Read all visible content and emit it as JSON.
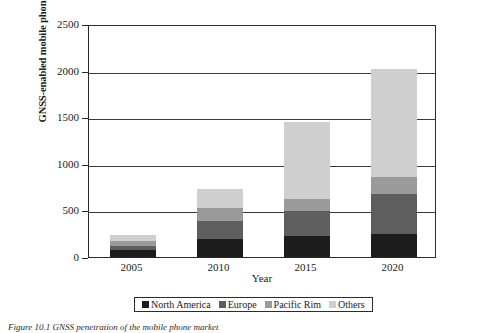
{
  "chart_data": {
    "type": "bar",
    "stacked": true,
    "title": "",
    "xlabel": "Year",
    "ylabel": "GNSS-enabled mobile phones in millions",
    "categories": [
      "2005",
      "2010",
      "2015",
      "2020"
    ],
    "ylim": [
      0,
      2500
    ],
    "yticks": [
      0,
      500,
      1000,
      1500,
      2000,
      2500
    ],
    "ytick_labels": [
      "0",
      "500",
      "1000",
      "1500",
      "2000",
      "2500"
    ],
    "grid": true,
    "grid_axis": "y",
    "legend_position": "bottom",
    "series": [
      {
        "name": "North America",
        "color": "#1c1c1c",
        "values": [
          70,
          190,
          225,
          250
        ]
      },
      {
        "name": "Europe",
        "color": "#5e5e5e",
        "values": [
          120,
          390,
          490,
          680
        ]
      },
      {
        "name": "Pacific Rim",
        "color": "#9a9a9a",
        "values": [
          175,
          530,
          620,
          855
        ]
      },
      {
        "name": "Others",
        "color": "#cfcfcf",
        "values": [
          240,
          730,
          1450,
          2020
        ]
      }
    ],
    "series_note": "values are cumulative stack tops in millions",
    "stack_totals": [
      240,
      730,
      1450,
      2020
    ]
  },
  "axis": {
    "y_title": "GNSS-enabled mobile phones in millions",
    "x_title": "Year"
  },
  "legend": {
    "items": [
      {
        "label": "North America",
        "color": "#1c1c1c"
      },
      {
        "label": "Europe",
        "color": "#5e5e5e"
      },
      {
        "label": "Pacific Rim",
        "color": "#9a9a9a"
      },
      {
        "label": "Others",
        "color": "#cfcfcf"
      }
    ]
  },
  "caption": {
    "text": "Figure 10.1   GNSS penetration of the mobile phone market"
  },
  "colors": {
    "axis": "#2b2b2b",
    "grid": "#3a3a3a",
    "background": "#ffffff"
  }
}
